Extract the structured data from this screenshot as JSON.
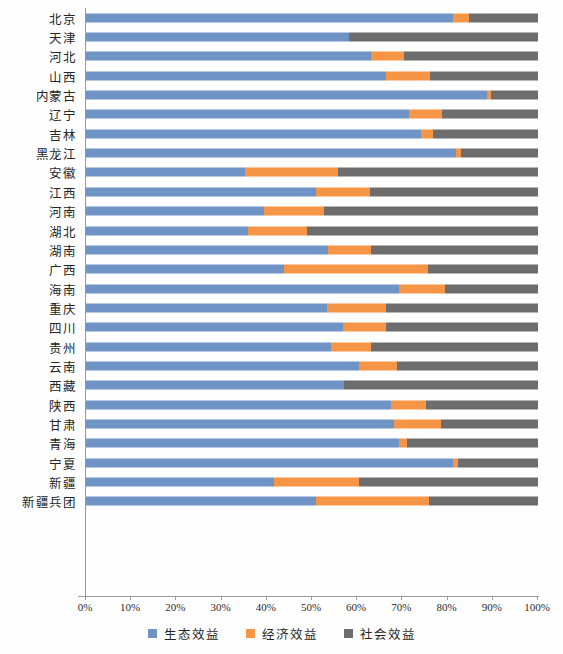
{
  "chart_data": {
    "type": "bar",
    "title": "",
    "subtitle": "",
    "xlabel": "",
    "ylabel": "",
    "orientation": "horizontal",
    "stacked": true,
    "normalized": true,
    "grid": false,
    "legend_position": "bottom",
    "xlim": [
      0,
      100
    ],
    "xticks": [
      "0%",
      "10%",
      "20%",
      "30%",
      "40%",
      "50%",
      "60%",
      "70%",
      "80%",
      "90%",
      "100%"
    ],
    "xtick_values": [
      0,
      10,
      20,
      30,
      40,
      50,
      60,
      70,
      80,
      90,
      100
    ],
    "categories": [
      "北京",
      "天津",
      "河北",
      "山西",
      "内蒙古",
      "辽宁",
      "吉林",
      "黑龙江",
      "安徽",
      "江西",
      "河南",
      "湖北",
      "湖南",
      "广西",
      "海南",
      "重庆",
      "四川",
      "贵州",
      "云南",
      "西藏",
      "陕西",
      "甘肃",
      "青海",
      "宁夏",
      "新疆",
      "新疆兵团"
    ],
    "series": [
      {
        "name": "生态效益",
        "color": "#6f93c4",
        "values": [
          81.2,
          58.2,
          63.1,
          66.4,
          88.7,
          71.5,
          74.1,
          81.9,
          35.2,
          50.9,
          39.4,
          35.8,
          53.5,
          43.8,
          69.2,
          53.3,
          56.9,
          54.2,
          60.4,
          57.1,
          67.5,
          68.1,
          69.3,
          81.2,
          41.6,
          50.9
        ]
      },
      {
        "name": "经济效益",
        "color": "#f79546",
        "values": [
          3.6,
          0.0,
          7.3,
          9.8,
          1.0,
          7.2,
          2.6,
          1.1,
          20.5,
          12.0,
          13.2,
          13.0,
          9.5,
          31.9,
          10.3,
          13.1,
          9.4,
          8.9,
          8.5,
          0.0,
          7.8,
          10.5,
          1.7,
          1.2,
          18.9,
          24.9
        ]
      },
      {
        "name": "社会效益",
        "color": "#6d6d6d",
        "values": [
          15.2,
          41.8,
          29.6,
          23.8,
          10.3,
          21.3,
          23.3,
          17.0,
          44.3,
          37.1,
          47.4,
          51.2,
          37.0,
          24.3,
          20.5,
          33.6,
          33.7,
          36.9,
          31.1,
          42.9,
          24.7,
          21.4,
          29.0,
          17.6,
          39.5,
          24.2
        ]
      }
    ],
    "legend": [
      {
        "label": "生态效益",
        "color": "#6f93c4",
        "icon": "square-swatch-blue"
      },
      {
        "label": "经济效益",
        "color": "#f79546",
        "icon": "square-swatch-orange"
      },
      {
        "label": "社会效益",
        "color": "#6d6d6d",
        "icon": "square-swatch-gray"
      }
    ]
  }
}
